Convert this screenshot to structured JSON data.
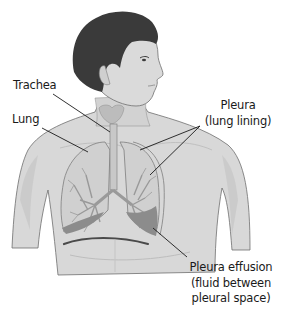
{
  "figure": {
    "colors": {
      "hair": "#3a3a3a",
      "skin": "#d9d9d9",
      "skin_shadow": "#c4c4c4",
      "outline": "#6e6e6e",
      "lung": "#cfcfcf",
      "bronchi": "#9a9a9a",
      "effusion": "#8c8c8c",
      "diaphragm_line": "#4a4a4a",
      "leader_line": "#1a1a1a",
      "text": "#1a1a1a"
    }
  },
  "labels": {
    "trachea": "Trachea",
    "lung": "Lung",
    "pleura": {
      "line1": "Pleura",
      "line2": "(lung lining)"
    },
    "effusion": {
      "line1": "Pleura effusion",
      "line2": "(fluid between",
      "line3": "pleural space)"
    }
  }
}
